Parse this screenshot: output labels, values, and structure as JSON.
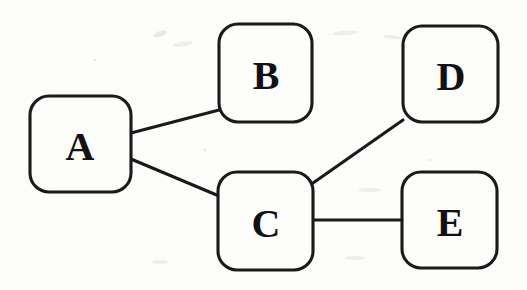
{
  "figure": {
    "type": "undirected-graph-diagram",
    "background_color": "#fdfdfb",
    "stroke_color": "#1a1a1a",
    "label_color": "#111111",
    "width": 527,
    "height": 290
  },
  "nodes": [
    {
      "id": "A",
      "label": "A",
      "x": 30,
      "y": 96,
      "w": 101,
      "h": 96,
      "cx": 80,
      "cy": 145
    },
    {
      "id": "B",
      "label": "B",
      "x": 219,
      "y": 24,
      "w": 93,
      "h": 98,
      "cx": 266,
      "cy": 74
    },
    {
      "id": "C",
      "label": "C",
      "x": 218,
      "y": 172,
      "w": 95,
      "h": 98,
      "cx": 266,
      "cy": 222
    },
    {
      "id": "D",
      "label": "D",
      "x": 403,
      "y": 26,
      "w": 95,
      "h": 96,
      "cx": 451,
      "cy": 75
    },
    {
      "id": "E",
      "label": "E",
      "x": 402,
      "y": 172,
      "w": 95,
      "h": 96,
      "cx": 450,
      "cy": 221
    }
  ],
  "edges": [
    {
      "id": "A-B",
      "from": "A",
      "to": "B",
      "x1": 131,
      "y1": 133,
      "x2": 219,
      "y2": 110
    },
    {
      "id": "A-C",
      "from": "A",
      "to": "C",
      "x1": 131,
      "y1": 159,
      "x2": 219,
      "y2": 196
    },
    {
      "id": "C-D",
      "from": "C",
      "to": "D",
      "x1": 313,
      "y1": 183,
      "x2": 403,
      "y2": 120
    },
    {
      "id": "C-E",
      "from": "C",
      "to": "E",
      "x1": 313,
      "y1": 220,
      "x2": 402,
      "y2": 220
    }
  ]
}
